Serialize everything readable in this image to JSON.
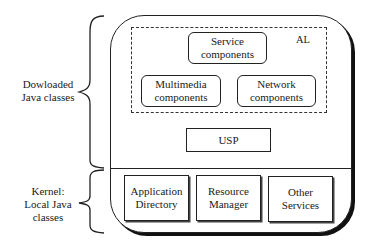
{
  "left_labels": {
    "downloaded": [
      "Dowloaded",
      "Java classes"
    ],
    "kernel": [
      "Kernel:",
      "Local Java",
      "classes"
    ]
  },
  "al_region": {
    "label": "AL",
    "boxes": {
      "service": [
        "Service",
        "components"
      ],
      "multimedia": [
        "Multimedia",
        "components"
      ],
      "network": [
        "Network",
        "components"
      ]
    }
  },
  "usp": {
    "label": "USP"
  },
  "kernel_boxes": {
    "app_directory": [
      "Application",
      "Directory"
    ],
    "resource_manager": [
      "Resource",
      "Manager"
    ],
    "other_services": [
      "Other",
      "Services"
    ]
  }
}
